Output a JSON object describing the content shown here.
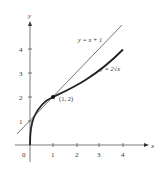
{
  "diagram": {
    "type": "function-graph",
    "axes": {
      "x_label": "x",
      "y_label": "y",
      "origin_label": "0",
      "x_ticks": [
        "1",
        "2",
        "3",
        "4"
      ],
      "y_ticks": [
        "1",
        "2",
        "3",
        "4"
      ]
    },
    "curves": [
      {
        "name": "tangent-line",
        "label": "y = x + 1",
        "color": "#555555"
      },
      {
        "name": "sqrt-curve",
        "label": "y = 2√x",
        "color": "#222222"
      }
    ],
    "point": {
      "label": "(1, 2)",
      "x": 1,
      "y": 2
    }
  }
}
